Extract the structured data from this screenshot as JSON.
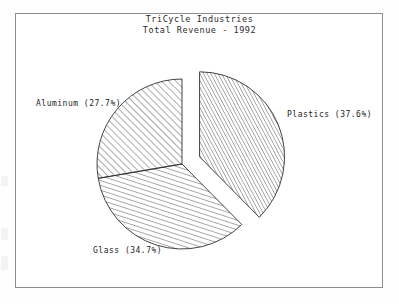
{
  "figure": {
    "title_line1": "TriCycle Industries",
    "title_line2": "Total Revenue - 1992",
    "frame_color": "#8d8d8d",
    "background_color": "#ffffff",
    "outline_color": "#303030"
  },
  "chart_data": {
    "type": "pie",
    "title": "TriCycle Industries",
    "subtitle": "Total Revenue - 1992",
    "xlabel": "",
    "ylabel": "",
    "categories": [
      "Plastics",
      "Glass",
      "Aluminum"
    ],
    "values": [
      37.6,
      34.7,
      27.7
    ],
    "value_unit": "percent",
    "start_angle_deg": 90,
    "direction": "clockwise",
    "exploded": [
      "Plastics"
    ],
    "legend": "none",
    "grid": false,
    "labels": [
      {
        "name": "Plastics",
        "percent": 37.6,
        "text": "Plastics (37.6%)",
        "hatch": "diagonal-dense",
        "exploded": true
      },
      {
        "name": "Glass",
        "percent": 34.7,
        "text": "Glass (34.7%)",
        "hatch": "diagonal-steep",
        "exploded": false
      },
      {
        "name": "Aluminum",
        "percent": 27.7,
        "text": "Aluminum (27.7%)",
        "hatch": "diagonal-45",
        "exploded": false
      }
    ]
  }
}
